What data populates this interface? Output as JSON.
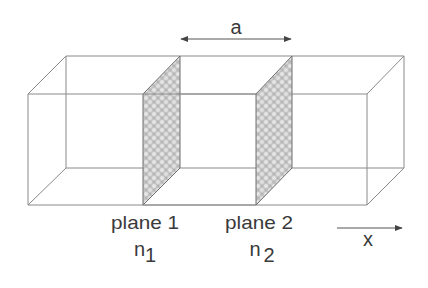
{
  "diagram": {
    "type": "3d-box-with-planes",
    "spacing_label": "a",
    "axis_label": "x",
    "planes": [
      {
        "name": "plane 1",
        "index_symbol": "n",
        "index_subscript": "1"
      },
      {
        "name": "plane 2",
        "index_symbol": "n",
        "index_subscript": "2"
      }
    ],
    "colors": {
      "edge": "#8a8a8a",
      "plane_fill": "#c8c8c8",
      "text": "#3a3a3a",
      "arrow": "#555555"
    }
  }
}
